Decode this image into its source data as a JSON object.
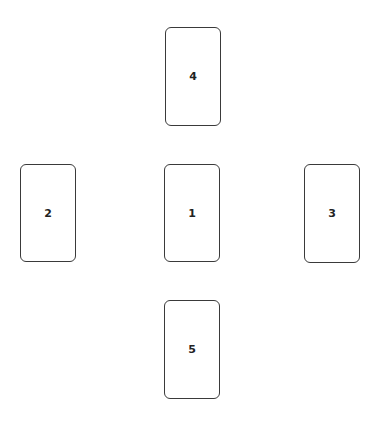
{
  "spread": {
    "cards": [
      {
        "position": "1",
        "x": 164,
        "y": 164,
        "w": 56,
        "h": 98
      },
      {
        "position": "2",
        "x": 20,
        "y": 164,
        "w": 56,
        "h": 98
      },
      {
        "position": "3",
        "x": 304,
        "y": 164,
        "w": 56,
        "h": 99
      },
      {
        "position": "4",
        "x": 165,
        "y": 27,
        "w": 56,
        "h": 99
      },
      {
        "position": "5",
        "x": 164,
        "y": 300,
        "w": 56,
        "h": 99
      }
    ],
    "colors": {
      "outline": "#3a3a3a",
      "label": "#222222",
      "background": "#ffffff"
    }
  }
}
